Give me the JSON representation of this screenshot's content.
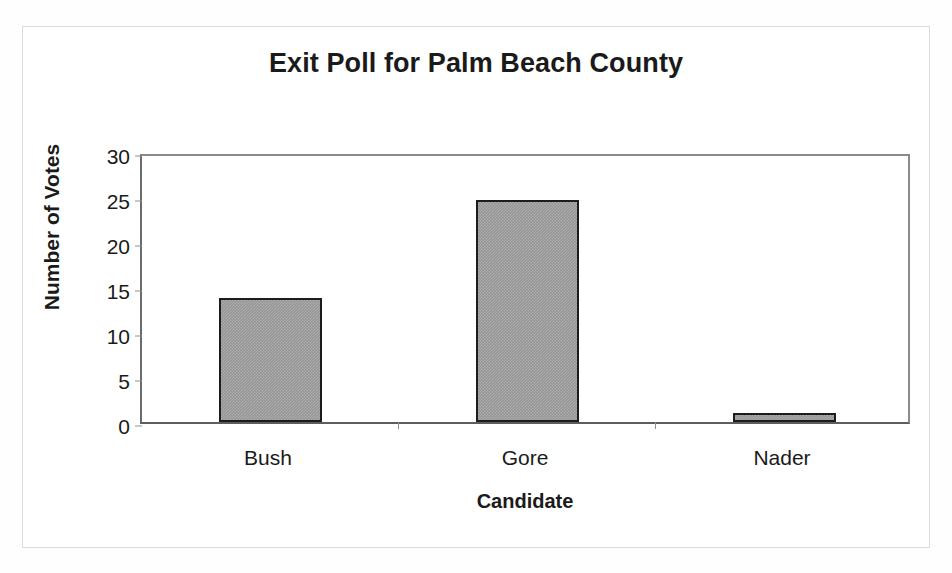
{
  "chart_data": {
    "type": "bar",
    "title": "Exit Poll for Palm Beach County",
    "xlabel": "Candidate",
    "ylabel": "Number of Votes",
    "categories": [
      "Bush",
      "Gore",
      "Nader"
    ],
    "values": [
      14,
      25,
      1
    ],
    "series": [
      {
        "name": "Number of Votes",
        "values": [
          14,
          25,
          1
        ]
      }
    ],
    "ylim": [
      0,
      30
    ],
    "yticks": [
      0,
      5,
      10,
      15,
      20,
      25,
      30
    ],
    "ytick_labels": [
      "0",
      "5",
      "10",
      "15",
      "20",
      "25",
      "30"
    ],
    "grid": false,
    "legend": false,
    "legend_position": "none",
    "bar_fill_color": "#959595",
    "bar_border_color": "#1c1c1c",
    "axis_color": "#7d7d7d",
    "text_color": "#1a1a1a",
    "background_color": "#ffffff"
  },
  "axis": {
    "y": {
      "title": "Number of Votes",
      "ticks": [
        {
          "label": "30",
          "value": 30
        },
        {
          "label": "25",
          "value": 25
        },
        {
          "label": "20",
          "value": 20
        },
        {
          "label": "15",
          "value": 15
        },
        {
          "label": "10",
          "value": 10
        },
        {
          "label": "5",
          "value": 5
        },
        {
          "label": "0",
          "value": 0
        }
      ]
    },
    "x": {
      "title": "Candidate",
      "ticks": [
        {
          "label": "Bush"
        },
        {
          "label": "Gore"
        },
        {
          "label": "Nader"
        }
      ]
    }
  }
}
